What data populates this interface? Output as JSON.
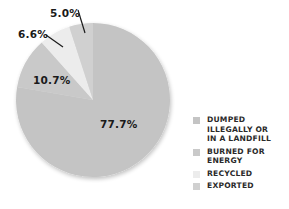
{
  "chart_data": {
    "type": "pie",
    "title": "",
    "start_angle_deg": 0,
    "direction": "clockwise",
    "slices": [
      {
        "label": "DUMPED ILLEGALLY OR IN A LANDFILL",
        "value": 77.7,
        "display": "77.7%",
        "color": "#c4c4c4"
      },
      {
        "label": "BURNED FOR ENERGY",
        "value": 10.7,
        "display": "10.7%",
        "color": "#c9c9c9"
      },
      {
        "label": "RECYCLED",
        "value": 6.6,
        "display": "6.6%",
        "color": "#ececec"
      },
      {
        "label": "EXPORTED",
        "value": 5.0,
        "display": "5.0%",
        "color": "#d0d0d0"
      }
    ],
    "legend_position": "right-bottom"
  },
  "labels": {
    "dumped": "77.7%",
    "burned": "10.7%",
    "recycled": "6.6%",
    "exported": "5.0%"
  },
  "legend": {
    "items": [
      {
        "text": "DUMPED\nILLEGALLY OR\nIN A LANDFILL",
        "color": "#c4c4c4"
      },
      {
        "text": "BURNED FOR\nENERGY",
        "color": "#c9c9c9"
      },
      {
        "text": "RECYCLED",
        "color": "#ececec"
      },
      {
        "text": "EXPORTED",
        "color": "#d0d0d0"
      }
    ]
  }
}
